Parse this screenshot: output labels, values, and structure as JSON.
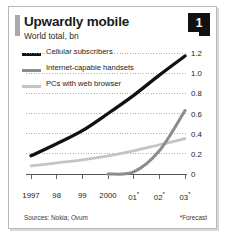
{
  "figure": {
    "number_badge": "1",
    "title": "Upwardly mobile",
    "subtitle": "World total, bn",
    "sources": "Sources: Nokia; Ovum",
    "forecast_note": "*Forecast"
  },
  "colors": {
    "cellular": "#111111",
    "handsets": "#8c8c8c",
    "pcs": "#c4c4c4",
    "gridline": "#9a9a9a",
    "axis": "#555555",
    "frame": "#b8b8b8",
    "badge_bg": "#111111",
    "badge_text": "#ffffff",
    "accent_bar": "#a9a9a9"
  },
  "legend": {
    "position": "top-left",
    "items": [
      {
        "label": "Cellular subscribers",
        "swatch": "cell"
      },
      {
        "label": "Internet-capable handsets",
        "swatch": "net"
      },
      {
        "label": "PCs with web browser",
        "swatch": "pc"
      }
    ]
  },
  "chart_data": {
    "type": "line",
    "title": "Upwardly mobile",
    "subtitle": "World total, bn",
    "xlabel": "",
    "ylabel": "World total, bn",
    "ylim": [
      0,
      1.2
    ],
    "yticks": [
      0,
      0.2,
      0.4,
      0.6,
      0.8,
      1.0,
      1.2
    ],
    "ytick_labels": [
      "0",
      "0.2",
      "0.4",
      "0.6",
      "0.8",
      "1.0",
      "1.2"
    ],
    "grid": "horizontal-dotted",
    "categories": [
      "1997",
      "98",
      "99",
      "2000",
      "01*",
      "02*",
      "03*"
    ],
    "xtick_labels": [
      "1997",
      "98",
      "99",
      "2000",
      "01*",
      "02*",
      "03*"
    ],
    "forecast_from": "01*",
    "series": [
      {
        "name": "Cellular subscribers",
        "color": "#111111",
        "values": [
          0.18,
          0.3,
          0.43,
          0.6,
          0.78,
          0.98,
          1.17
        ]
      },
      {
        "name": "Internet-capable handsets",
        "color": "#8c8c8c",
        "values": [
          0,
          0,
          0,
          0,
          0.02,
          0.23,
          0.63
        ]
      },
      {
        "name": "PCs with web browser",
        "color": "#c4c4c4",
        "values": [
          0.08,
          0.11,
          0.14,
          0.18,
          0.23,
          0.29,
          0.35
        ]
      }
    ]
  },
  "axis_labels": {
    "y": [
      "1.2",
      "1.0",
      "0.8",
      "0.6",
      "0.4",
      "0.2",
      "0"
    ],
    "x": [
      "1997",
      "98",
      "99",
      "2000",
      "01*",
      "02*",
      "03*"
    ]
  }
}
